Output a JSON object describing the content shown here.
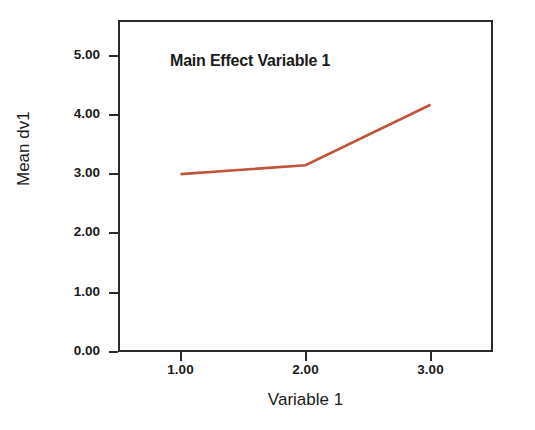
{
  "chart_data": {
    "type": "line",
    "title": "Main Effect Variable 1",
    "xlabel": "Variable 1",
    "ylabel": "Mean dv1",
    "x": [
      1.0,
      2.0,
      3.0
    ],
    "categories": [
      "1.00",
      "2.00",
      "3.00"
    ],
    "series": [
      {
        "name": "Mean dv1",
        "values": [
          3.0,
          3.15,
          4.17
        ],
        "color": "#c0553a"
      }
    ],
    "xlim": [
      0.5,
      3.5
    ],
    "ylim": [
      0.0,
      5.6
    ],
    "xticks": [
      1.0,
      2.0,
      3.0
    ],
    "xtick_labels": [
      "1.00",
      "2.00",
      "3.00"
    ],
    "yticks": [
      0.0,
      1.0,
      2.0,
      3.0,
      4.0,
      5.0
    ],
    "ytick_labels": [
      "0.00",
      "1.00",
      "2.00",
      "3.00",
      "4.00",
      "5.00"
    ],
    "grid": false,
    "legend": false,
    "legend_position": "none",
    "markers": false,
    "frame_color": "#2b2b2b",
    "background_color": "#ffffff",
    "annotations": []
  }
}
